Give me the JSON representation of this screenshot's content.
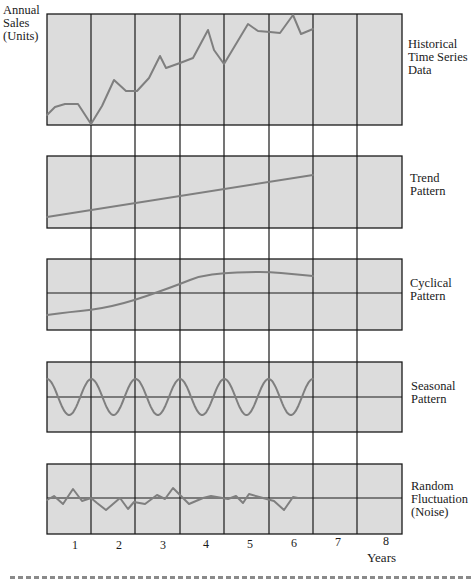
{
  "chart_data": {
    "type": "line",
    "ylabel": "Annual Sales (Units)",
    "xlabel": "Years",
    "x_ticks": [
      "1",
      "2",
      "3",
      "4",
      "5",
      "6",
      "7",
      "8"
    ],
    "grid": true,
    "panels": [
      {
        "name": "Historical Time Series Data",
        "label_lines": [
          "Historical",
          "Time Series",
          "Data"
        ],
        "midline": false,
        "top": 14,
        "bottom": 125,
        "points": [
          [
            47,
            115
          ],
          [
            55,
            107
          ],
          [
            65,
            104
          ],
          [
            78,
            104
          ],
          [
            91,
            124
          ],
          [
            102,
            106
          ],
          [
            114,
            80
          ],
          [
            126,
            91
          ],
          [
            137,
            91
          ],
          [
            149,
            78
          ],
          [
            160,
            56
          ],
          [
            166,
            68
          ],
          [
            180,
            63
          ],
          [
            193,
            58
          ],
          [
            208,
            30
          ],
          [
            214,
            50
          ],
          [
            224,
            64
          ],
          [
            248,
            24
          ],
          [
            258,
            31
          ],
          [
            270,
            32
          ],
          [
            280,
            33
          ],
          [
            293,
            15
          ],
          [
            301,
            34
          ],
          [
            313,
            29
          ]
        ]
      },
      {
        "name": "Trend Pattern",
        "label_lines": [
          "Trend",
          "Pattern"
        ],
        "midline": false,
        "top": 156,
        "bottom": 228,
        "points": [
          [
            47,
            217
          ],
          [
            313,
            175
          ]
        ]
      },
      {
        "name": "Cyclical Pattern",
        "label_lines": [
          "Cyclical",
          "Pattern"
        ],
        "midline": true,
        "midline_y": 293,
        "top": 259,
        "bottom": 330,
        "points": [
          [
            47,
            315
          ],
          [
            70,
            312
          ],
          [
            91,
            310
          ],
          [
            113,
            306
          ],
          [
            135,
            300
          ],
          [
            158,
            292
          ],
          [
            180,
            284
          ],
          [
            200,
            276
          ],
          [
            224,
            273
          ],
          [
            250,
            272
          ],
          [
            270,
            272
          ],
          [
            292,
            274
          ],
          [
            313,
            276
          ]
        ]
      },
      {
        "name": "Seasonal Pattern",
        "label_lines": [
          "Seasonal",
          "Pattern"
        ],
        "midline": true,
        "midline_y": 397,
        "top": 362,
        "bottom": 432,
        "cycles": 6,
        "amplitude": 18
      },
      {
        "name": "Random Fluctuation (Noise)",
        "label_lines": [
          "Random",
          "Fluctuation",
          "(Noise)"
        ],
        "midline": true,
        "midline_y": 498,
        "top": 464,
        "bottom": 534,
        "points": [
          [
            47,
            500
          ],
          [
            54,
            496
          ],
          [
            63,
            504
          ],
          [
            73,
            489
          ],
          [
            82,
            501
          ],
          [
            91,
            498
          ],
          [
            97,
            503
          ],
          [
            106,
            510
          ],
          [
            120,
            498
          ],
          [
            128,
            509
          ],
          [
            134,
            502
          ],
          [
            145,
            504
          ],
          [
            149,
            501
          ],
          [
            157,
            495
          ],
          [
            165,
            499
          ],
          [
            173,
            488
          ],
          [
            189,
            504
          ],
          [
            203,
            498
          ],
          [
            211,
            496
          ],
          [
            228,
            499
          ],
          [
            236,
            496
          ],
          [
            243,
            503
          ],
          [
            249,
            494
          ],
          [
            263,
            498
          ],
          [
            274,
            501
          ],
          [
            284,
            510
          ],
          [
            293,
            497
          ],
          [
            298,
            498
          ]
        ]
      }
    ],
    "colors": {
      "panel_fill": "#dcdcdc",
      "grid": "#1a1a1a",
      "series": "#7f7f7f"
    }
  },
  "labels": {
    "y_axis_lines": [
      "Annual",
      "Sales",
      "(Units)"
    ],
    "x_axis": "Years",
    "panels": [
      [
        "Historical",
        "Time Series",
        "Data"
      ],
      [
        "Trend",
        "Pattern"
      ],
      [
        "Cyclical",
        "Pattern"
      ],
      [
        "Seasonal",
        "Pattern"
      ],
      [
        "Random",
        "Fluctuation",
        "(Noise)"
      ]
    ],
    "years": [
      "1",
      "2",
      "3",
      "4",
      "5",
      "6",
      "7",
      "8"
    ]
  }
}
